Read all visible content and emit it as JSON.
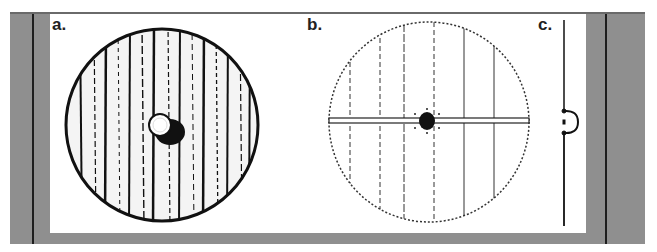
{
  "figure": {
    "panels": [
      {
        "id": "a",
        "label": "a.",
        "description": "Shield front view, wood-grain drawing with central boss"
      },
      {
        "id": "b",
        "label": "b.",
        "description": "Shield construction view, vertical planks with horizontal grip bar and central boss"
      },
      {
        "id": "c",
        "label": "c.",
        "description": "Shield side profile with boss"
      }
    ],
    "colors": {
      "frame": "#8f8f8f",
      "divider": "#1e1e1e",
      "panel": "#ffffff",
      "ink": "#111111"
    }
  }
}
